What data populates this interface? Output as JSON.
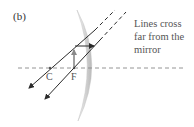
{
  "panel_label": "(b)",
  "annotation": {
    "lines": [
      "Lines cross",
      "far from the",
      "mirror"
    ]
  },
  "points": {
    "center": "C",
    "focus": "F"
  },
  "colors": {
    "ray": "#2b2b2b",
    "axis_dash": "#888888",
    "mirror_fill": "#cfcfcf",
    "object_arrow": "#8a8a8a",
    "text": "#555555"
  }
}
